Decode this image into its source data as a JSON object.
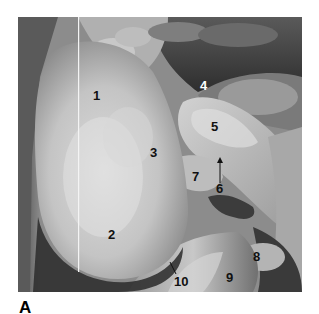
{
  "figure": {
    "panel_letter": "A",
    "image_description": "Grayscale anatomical dissection photograph with numbered structure labels",
    "labels": [
      {
        "id": "1",
        "text": "1",
        "x": 93,
        "y": 89,
        "color": "dark"
      },
      {
        "id": "2",
        "text": "2",
        "x": 108,
        "y": 228,
        "color": "dark"
      },
      {
        "id": "3",
        "text": "3",
        "x": 150,
        "y": 146,
        "color": "dark"
      },
      {
        "id": "4",
        "text": "4",
        "x": 200,
        "y": 79,
        "color": "light"
      },
      {
        "id": "5",
        "text": "5",
        "x": 211,
        "y": 120,
        "color": "dark"
      },
      {
        "id": "6",
        "text": "6",
        "x": 216,
        "y": 182,
        "color": "dark"
      },
      {
        "id": "7",
        "text": "7",
        "x": 192,
        "y": 170,
        "color": "dark"
      },
      {
        "id": "8",
        "text": "8",
        "x": 253,
        "y": 250,
        "color": "dark"
      },
      {
        "id": "9",
        "text": "9",
        "x": 226,
        "y": 271,
        "color": "dark"
      },
      {
        "id": "10",
        "text": "10",
        "x": 174,
        "y": 275,
        "color": "dark"
      }
    ],
    "pointers": [
      {
        "from_label": "6",
        "type": "arrow",
        "x1": 220,
        "y1": 183,
        "x2": 220,
        "y2": 158
      },
      {
        "from_label": "10",
        "type": "line",
        "x1": 176,
        "y1": 274,
        "x2": 170,
        "y2": 262
      }
    ]
  }
}
